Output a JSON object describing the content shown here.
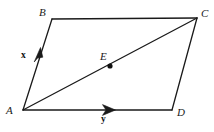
{
  "figure": {
    "background_color": "#ffffff",
    "stroke_color": "#1a1a1a",
    "stroke_width": 1.3,
    "type": "geometry-diagram",
    "vertices": {
      "A": {
        "label": "A",
        "x": 23,
        "y": 110,
        "label_x": 6,
        "label_y": 106
      },
      "B": {
        "label": "B",
        "x": 52,
        "y": 19,
        "label_x": 39,
        "label_y": 7
      },
      "C": {
        "label": "C",
        "x": 197,
        "y": 18,
        "label_x": 201,
        "label_y": 8
      },
      "D": {
        "label": "D",
        "x": 172,
        "y": 110,
        "label_x": 177,
        "label_y": 108
      }
    },
    "interior_points": [
      {
        "name": "E",
        "label": "E",
        "x": 110,
        "y": 66,
        "label_x": 100,
        "label_y": 50,
        "dot_radius": 2.6
      }
    ],
    "edges": [
      {
        "name": "AB",
        "from": "A",
        "to": "B",
        "arrow": true
      },
      {
        "name": "BC",
        "from": "B",
        "to": "C",
        "arrow": false
      },
      {
        "name": "CD",
        "from": "C",
        "to": "D",
        "arrow": false
      },
      {
        "name": "AD",
        "from": "A",
        "to": "D",
        "arrow": true
      },
      {
        "name": "AC",
        "from": "A",
        "to": "C",
        "arrow": false,
        "style": "diagonal"
      }
    ],
    "vectors": [
      {
        "name": "x",
        "label": "x",
        "along_edge": "AB",
        "arrow_tip_x": 40,
        "arrow_tip_y": 50,
        "label_x": 21,
        "label_y": 51
      },
      {
        "name": "y",
        "label": "y",
        "along_edge": "AD",
        "arrow_tip_x": 114,
        "arrow_tip_y": 110,
        "label_x": 101,
        "label_y": 115
      }
    ]
  }
}
